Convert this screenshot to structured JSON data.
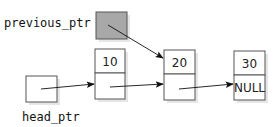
{
  "diagram": {
    "type": "linked-list",
    "pointers": [
      {
        "id": "previous_ptr",
        "label": "previous_ptr",
        "shaded": true,
        "points_to": "node_20"
      },
      {
        "id": "head_ptr",
        "label": "head_ptr",
        "shaded": false,
        "points_to": "node_10"
      }
    ],
    "nodes": [
      {
        "id": "node_10",
        "value": "10",
        "next": "node_20"
      },
      {
        "id": "node_20",
        "value": "20",
        "next": "node_30"
      },
      {
        "id": "node_30",
        "value": "30",
        "next": "NULL"
      }
    ],
    "null_label": "NULL",
    "colors": {
      "shaded_fill": "#a8a8a8",
      "box_stroke": "#555555",
      "arrow": "#111111"
    }
  }
}
